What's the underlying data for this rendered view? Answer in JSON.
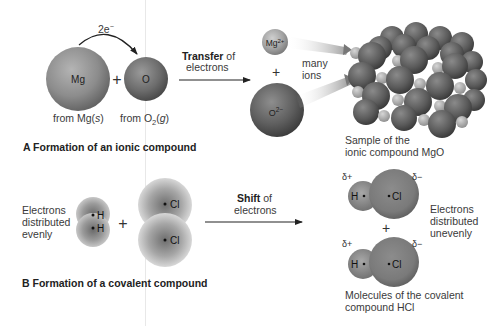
{
  "section_a": {
    "caption": "A  Formation of an ionic compound",
    "electron_label": "2e",
    "electron_sup": "−",
    "atom_mg": "Mg",
    "atom_o": "O",
    "plus": "+",
    "from_mg_prefix": "from Mg(",
    "from_mg_state": "s",
    "from_mg_suffix": ")",
    "from_o2_prefix": "from O",
    "from_o2_sub": "2",
    "from_o2_open": "(",
    "from_o2_state": "g",
    "from_o2_close": ")",
    "transfer_bold": "Transfer",
    "transfer_rest": " of",
    "transfer_line2": "electrons",
    "ion_mg": "Mg",
    "ion_mg_charge": "2+",
    "ion_o": "O",
    "ion_o_charge": "2−",
    "many_ions_line1": "many",
    "many_ions_line2": "ions",
    "sample_line1": "Sample of the",
    "sample_line2": "ionic compound MgO"
  },
  "section_b": {
    "caption": "B  Formation of a covalent compound",
    "even_line1": "Electrons",
    "even_line2": "distributed",
    "even_line3": "evenly",
    "h_label": "H",
    "cl_label": "Cl",
    "plus": "+",
    "shift_bold": "Shift",
    "shift_rest": " of",
    "shift_line2": "electrons",
    "delta_plus": "δ+",
    "delta_minus": "δ−",
    "uneven_line1": "Electrons",
    "uneven_line2": "distributed",
    "uneven_line3": "unevenly",
    "molecules_line1": "Molecules of the covalent",
    "molecules_line2": "compound HCl"
  },
  "colors": {
    "background": "#ffffff",
    "sphere_mg_atom": "#8a8a8a",
    "sphere_o_atom": "#6a6a6a",
    "sphere_ion_o": "#5c5c5c",
    "sphere_ion_mg": "#a0a0a0",
    "arrow": "#222222",
    "divider": "#e6e6e6"
  }
}
